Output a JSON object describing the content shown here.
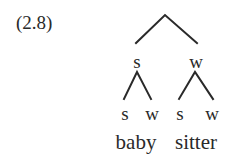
{
  "example_label": "(2.8)",
  "tree": {
    "root": {
      "x": 165,
      "y": 15
    },
    "level1": [
      {
        "label": "s",
        "x": 137,
        "y": 56
      },
      {
        "label": "w",
        "x": 195,
        "y": 56
      }
    ],
    "level2": [
      {
        "label": "s",
        "x": 125,
        "y": 108
      },
      {
        "label": "w",
        "x": 152,
        "y": 108
      },
      {
        "label": "s",
        "x": 180,
        "y": 108
      },
      {
        "label": "w",
        "x": 212,
        "y": 108
      }
    ],
    "words": [
      {
        "text": "baby",
        "x": 137,
        "y": 133
      },
      {
        "text": "sitter",
        "x": 196,
        "y": 133
      }
    ]
  },
  "colors": {
    "ink": "#2a2a2a",
    "background": "#ffffff"
  }
}
